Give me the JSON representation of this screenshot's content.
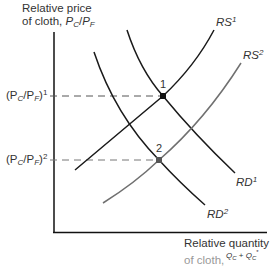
{
  "diagram": {
    "y_axis_label_line1": "Relative price",
    "y_axis_label_line2_prefix": "of cloth, ",
    "y_axis_symbol": {
      "num": "P",
      "num_sub": "C",
      "den": "P",
      "den_sub": "F"
    },
    "x_axis_label": "Relative quantity",
    "x_axis_label_partial": "of cloth,",
    "x_axis_fraction_top": {
      "a": "Q",
      "a_sub": "C",
      "plus": " + ",
      "b": "Q",
      "b_sub": "C",
      "b_star": "*"
    },
    "price_level_1": {
      "text": "(P",
      "sub": "C",
      "mid": "/P",
      "sub2": "F",
      "close": ")",
      "sup": "1"
    },
    "price_level_2": {
      "text": "(P",
      "sub": "C",
      "mid": "/P",
      "sub2": "F",
      "close": ")",
      "sup": "2"
    },
    "curves": [
      {
        "name": "RS",
        "sup": "1",
        "color": "#1a1a1a"
      },
      {
        "name": "RS",
        "sup": "2",
        "color": "#707070"
      },
      {
        "name": "RD",
        "sup": "1",
        "color": "#1a1a1a"
      },
      {
        "name": "RD",
        "sup": "2",
        "color": "#1a1a1a"
      }
    ],
    "points": [
      {
        "label": "1",
        "color": "#111111"
      },
      {
        "label": "2",
        "color": "#555555"
      }
    ]
  }
}
